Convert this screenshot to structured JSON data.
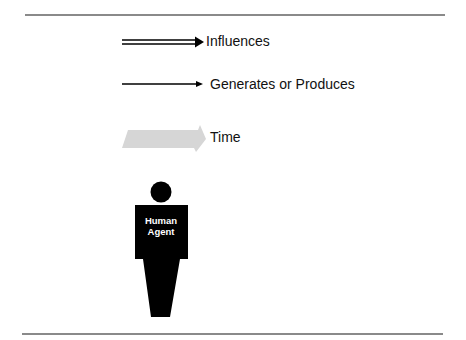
{
  "legend": {
    "items": [
      {
        "id": "influences",
        "label": "Influences",
        "symbol": "double-arrow"
      },
      {
        "id": "generates",
        "label": "Generates or Produces",
        "symbol": "single-arrow"
      },
      {
        "id": "time",
        "label": "Time",
        "symbol": "gray-block-arrow"
      }
    ]
  },
  "figure": {
    "line1": "Human",
    "line2": "Agent"
  },
  "colors": {
    "rule": "#8a8a8a",
    "arrow": "#000000",
    "time_arrow": "#d6d6d6",
    "figure": "#000000",
    "figure_text": "#ffffff"
  }
}
